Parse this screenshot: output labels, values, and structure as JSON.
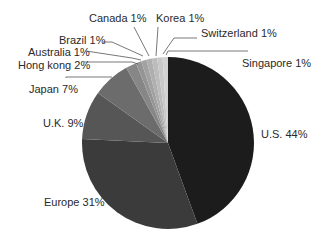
{
  "chart_data": {
    "type": "pie",
    "title": "",
    "start_angle_deg": 0,
    "direction": "clockwise",
    "slices": [
      {
        "label": "U.S.",
        "value": 44,
        "display": "U.S. 44%",
        "color": "#1c1c1c"
      },
      {
        "label": "Europe",
        "value": 31,
        "display": "Europe 31%",
        "color": "#3b3b3b"
      },
      {
        "label": "U.K.",
        "value": 9,
        "display": "U.K. 9%",
        "color": "#565656"
      },
      {
        "label": "Japan",
        "value": 7,
        "display": "Japan 7%",
        "color": "#6c6c6c"
      },
      {
        "label": "Hong kong",
        "value": 2,
        "display": "Hong kong 2%",
        "color": "#878787"
      },
      {
        "label": "Australia",
        "value": 1,
        "display": "Australia 1%",
        "color": "#959595"
      },
      {
        "label": "Brazil",
        "value": 1,
        "display": "Brazil 1%",
        "color": "#a2a2a2"
      },
      {
        "label": "Canada",
        "value": 1,
        "display": "Canada 1%",
        "color": "#afafaf"
      },
      {
        "label": "Korea",
        "value": 1,
        "display": "Korea 1%",
        "color": "#bcbcbc"
      },
      {
        "label": "Switzerland",
        "value": 1,
        "display": "Switzerland 1%",
        "color": "#c8c8c8"
      },
      {
        "label": "Singapore",
        "value": 1,
        "display": "Singapore 1%",
        "color": "#d2d2d2"
      }
    ],
    "legend": "none (direct labels with leader lines)"
  },
  "labels": {
    "us": "U.S. 44%",
    "europe": "Europe 31%",
    "uk": "U.K. 9%",
    "japan": "Japan 7%",
    "hongkong": "Hong kong 2%",
    "australia": "Australia 1%",
    "brazil": "Brazil 1%",
    "canada": "Canada 1%",
    "korea": "Korea 1%",
    "switzerland": "Switzerland 1%",
    "singapore": "Singapore 1%"
  }
}
